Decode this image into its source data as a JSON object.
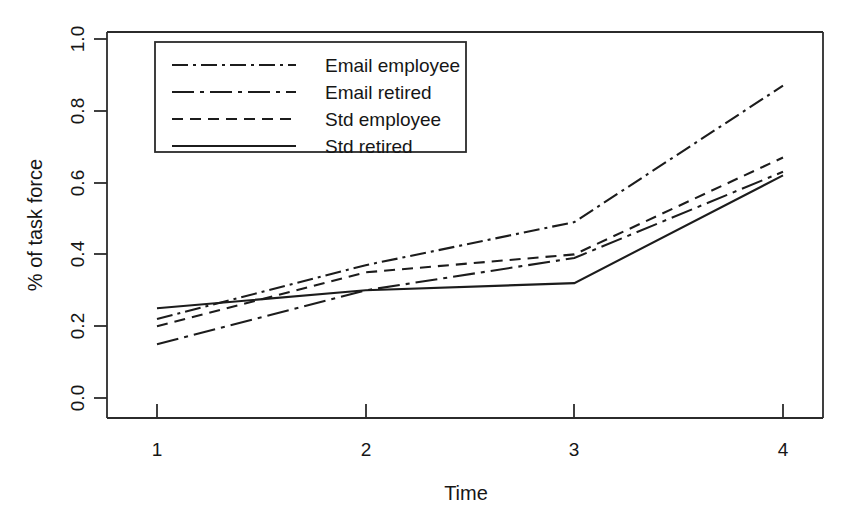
{
  "chart_data": {
    "type": "line",
    "title": "",
    "subtitle": "",
    "xlabel": "Time",
    "ylabel": "% of task force",
    "categories": [
      "1",
      "2",
      "3",
      "4"
    ],
    "x": [
      1,
      2,
      3,
      4
    ],
    "xlim": [
      1,
      4
    ],
    "ylim": [
      0.0,
      1.0
    ],
    "grid": false,
    "legend_position": "top-left",
    "xticks": [
      "1",
      "2",
      "3",
      "4"
    ],
    "yticks": [
      "0.0",
      "0.2",
      "0.4",
      "0.6",
      "0.8",
      "1.0"
    ],
    "ytick_values": [
      0.0,
      0.2,
      0.4,
      0.6,
      0.8,
      1.0
    ],
    "series": [
      {
        "name": "Email employee",
        "dash": "dashdot",
        "dasharray": "16,5,3,5",
        "values": [
          0.22,
          0.37,
          0.49,
          0.87
        ]
      },
      {
        "name": "Email retired",
        "dash": "longdashdot",
        "dasharray": "22,6,4,6",
        "values": [
          0.15,
          0.3,
          0.39,
          0.63
        ]
      },
      {
        "name": "Std employee",
        "dash": "dashed",
        "dasharray": "11,7",
        "values": [
          0.2,
          0.35,
          0.4,
          0.67
        ]
      },
      {
        "name": "Std retired",
        "dash": "solid",
        "dasharray": "",
        "values": [
          0.25,
          0.3,
          0.32,
          0.62
        ]
      }
    ],
    "colors": {
      "line": "#1c1c1c",
      "axis": "#2b2b2b",
      "background": "#ffffff",
      "text": "#161616"
    }
  },
  "legend": {
    "entries": [
      {
        "label": "Email employee"
      },
      {
        "label": "Email retired"
      },
      {
        "label": "Std employee"
      },
      {
        "label": "Std retired"
      }
    ]
  },
  "axes": {
    "x_title": "Time",
    "y_title": "% of task force",
    "x_tick_labels": [
      "1",
      "2",
      "3",
      "4"
    ],
    "y_tick_labels": [
      "0.0",
      "0.2",
      "0.4",
      "0.6",
      "0.8",
      "1.0"
    ]
  }
}
